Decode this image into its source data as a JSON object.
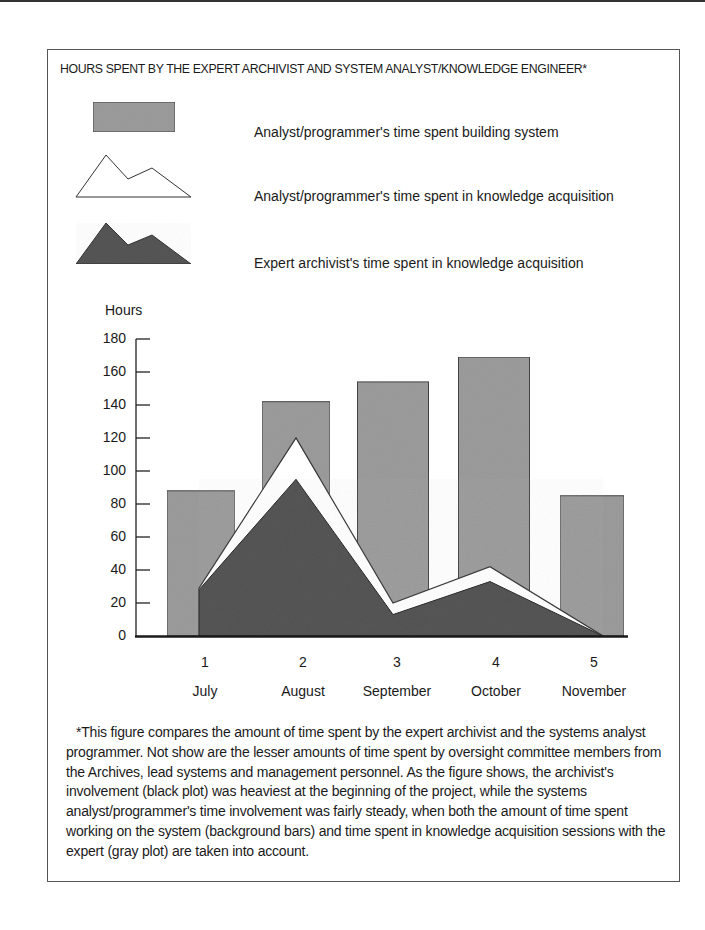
{
  "figure": {
    "title": "HOURS SPENT BY THE EXPERT ARCHIVIST AND SYSTEM ANALYST/KNOWLEDGE ENGINEER*",
    "legend": [
      {
        "key": "bars",
        "icon": "gray-rectangle-icon",
        "label": "Analyst/programmer's time spent building system",
        "color": "#9b9b9b"
      },
      {
        "key": "white_area",
        "icon": "white-mountain-icon",
        "label": "Analyst/programmer's time spent in knowledge acquisition",
        "color": "#ffffff"
      },
      {
        "key": "dark_area",
        "icon": "dark-mountain-icon",
        "label": "Expert archivist's time spent in knowledge acquisition",
        "color": "#555555"
      }
    ],
    "caption": "*This figure compares the amount of time spent by the expert archivist and the systems analyst programmer. Not show are the lesser amounts of time spent by oversight committee members from the Archives, lead systems and management personnel. As the figure shows, the archivist's involvement (black plot) was heaviest at the beginning of the project, while the systems analyst/programmer's time involvement was fairly steady, when both the amount of time spent working on the system (background bars) and time spent in knowledge acquisition sessions with the expert (gray plot) are taken into account."
  },
  "chart_data": {
    "type": "bar",
    "title": "HOURS SPENT BY THE EXPERT ARCHIVIST AND SYSTEM ANALYST/KNOWLEDGE ENGINEER*",
    "xlabel": "",
    "ylabel": "Hours",
    "ylim": [
      0,
      180
    ],
    "yticks": [
      0,
      20,
      40,
      60,
      80,
      100,
      120,
      140,
      160,
      180
    ],
    "grid": false,
    "legend_position": "top",
    "x_numbers": [
      "1",
      "2",
      "3",
      "4",
      "5"
    ],
    "categories": [
      "July",
      "August",
      "September",
      "October",
      "November"
    ],
    "series": [
      {
        "name": "Analyst/programmer's time spent building system",
        "type": "bar",
        "values": [
          88,
          142,
          154,
          169,
          85
        ]
      },
      {
        "name": "Analyst/programmer's time spent in knowledge acquisition",
        "type": "area",
        "values": [
          29,
          120,
          20,
          42,
          0
        ]
      },
      {
        "name": "Expert archivist's time spent in knowledge acquisition",
        "type": "area",
        "values": [
          28,
          95,
          13,
          33,
          0
        ]
      }
    ]
  }
}
